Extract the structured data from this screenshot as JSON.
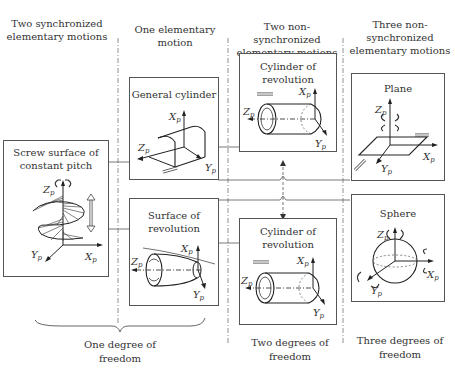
{
  "columns": [
    {
      "id": "two-sync",
      "title": "Two synchronized elementary motions"
    },
    {
      "id": "one-elem",
      "title": "One elementary motion"
    },
    {
      "id": "two-nonsync",
      "title": "Two non-synchronized elementary motions"
    },
    {
      "id": "three-nonsync",
      "title": "Three non-synchronized elementary motions"
    }
  ],
  "boxes": {
    "screw": {
      "title_line1": "Screw surface of",
      "title_line2": "constant pitch"
    },
    "general_cylinder": {
      "title": "General cylinder"
    },
    "surface_revolution": {
      "title_line1": "Surface of",
      "title_line2": "revolution"
    },
    "cylinder_top": {
      "title_line1": "Cylinder of",
      "title_line2": "revolution"
    },
    "cylinder_bottom": {
      "title_line1": "Cylinder of",
      "title_line2": "revolution"
    },
    "plane": {
      "title": "Plane"
    },
    "sphere": {
      "title": "Sphere"
    }
  },
  "axes": {
    "x": "X",
    "y": "Y",
    "z": "Z",
    "subscript": "p"
  },
  "footers": {
    "one_dof_line1": "One degree of",
    "one_dof_line2": "freedom",
    "two_dof_line1": "Two degrees of",
    "two_dof_line2": "freedom",
    "three_dof_line1": "Three degrees of",
    "three_dof_line2": "freedom"
  }
}
